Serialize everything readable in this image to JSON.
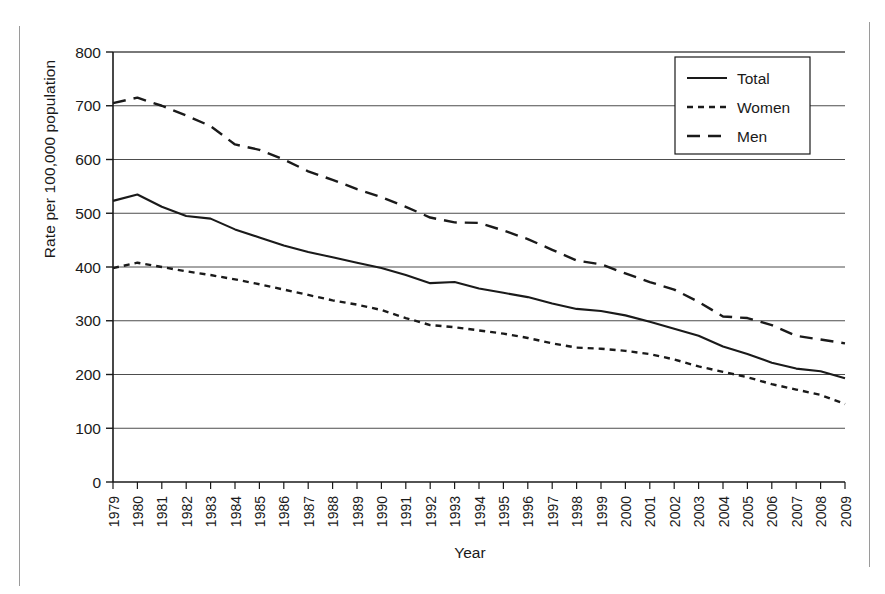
{
  "chart_data": {
    "type": "line",
    "title": "",
    "xlabel": "Year",
    "ylabel": "Rate per 100,000 population",
    "ylim": [
      0,
      800
    ],
    "ytick_step": 100,
    "yticks": [
      "0",
      "100",
      "200",
      "300",
      "400",
      "500",
      "600",
      "700",
      "800"
    ],
    "grid": "horizontal",
    "legend_position": "top-right",
    "categories": [
      "1979",
      "1980",
      "1981",
      "1982",
      "1983",
      "1984",
      "1985",
      "1986",
      "1987",
      "1988",
      "1989",
      "1990",
      "1991",
      "1992",
      "1993",
      "1994",
      "1995",
      "1996",
      "1997",
      "1998",
      "1999",
      "2000",
      "2001",
      "2002",
      "2003",
      "2004",
      "2005",
      "2006",
      "2007",
      "2008",
      "2009"
    ],
    "series": [
      {
        "name": "Total",
        "style": "solid",
        "color": "#1a1a1a",
        "values": [
          523,
          535,
          512,
          495,
          490,
          470,
          455,
          440,
          428,
          418,
          408,
          398,
          385,
          370,
          372,
          360,
          352,
          344,
          332,
          322,
          318,
          310,
          298,
          285,
          272,
          252,
          238,
          222,
          211,
          206,
          193
        ]
      },
      {
        "name": "Women",
        "style": "dotted",
        "color": "#1a1a1a",
        "values": [
          398,
          408,
          400,
          392,
          385,
          377,
          368,
          358,
          348,
          338,
          330,
          320,
          305,
          292,
          288,
          282,
          276,
          268,
          258,
          250,
          248,
          244,
          238,
          228,
          215,
          205,
          195,
          182,
          172,
          162,
          145
        ]
      },
      {
        "name": "Men",
        "style": "dashed",
        "color": "#1a1a1a",
        "values": [
          705,
          715,
          700,
          682,
          662,
          628,
          618,
          600,
          578,
          562,
          545,
          530,
          512,
          492,
          483,
          482,
          468,
          452,
          432,
          412,
          405,
          388,
          372,
          358,
          335,
          308,
          305,
          292,
          272,
          265,
          258
        ]
      }
    ]
  },
  "legend": {
    "items": [
      {
        "label": "Total",
        "style": "solid"
      },
      {
        "label": "Women",
        "style": "dotted"
      },
      {
        "label": "Men",
        "style": "dashed"
      }
    ]
  },
  "page": {
    "bottom_text": ""
  }
}
